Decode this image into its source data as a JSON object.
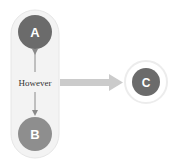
{
  "diagram": {
    "group": {
      "fill": "#f2f2f2",
      "stroke": "#e8e8e8"
    },
    "nodes": [
      {
        "id": "A",
        "label": "A",
        "color": "#6b6b6b"
      },
      {
        "id": "B",
        "label": "B",
        "color": "#8e8e8e"
      },
      {
        "id": "C",
        "label": "C",
        "color": "#6b6b6b",
        "halo": "#f0f0f0"
      }
    ],
    "edges": [
      {
        "from": "A",
        "to": "B",
        "type": "bidirectional",
        "label": "However",
        "color": "#8a8a8a"
      },
      {
        "from": "group",
        "to": "C",
        "type": "thick-arrow",
        "color": "#c8c8c8"
      }
    ]
  }
}
